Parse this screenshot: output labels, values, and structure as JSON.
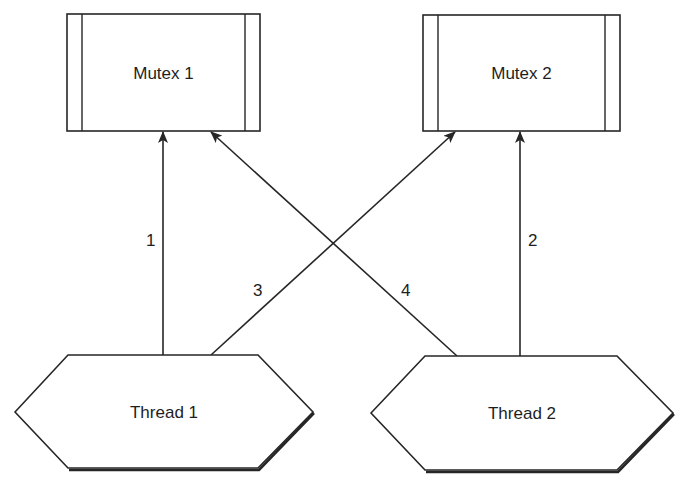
{
  "diagram": {
    "type": "resource-allocation / deadlock diagram",
    "colors": {
      "stroke": "#262626",
      "text": "#1e1e1e",
      "background": "#ffffff"
    },
    "mutexes": [
      {
        "id": "mutex1",
        "label": "Mutex 1",
        "x": 67,
        "y": 14,
        "w": 193,
        "h": 117,
        "inset": 15
      },
      {
        "id": "mutex2",
        "label": "Mutex 2",
        "x": 423,
        "y": 15,
        "w": 197,
        "h": 116,
        "inset": 15
      }
    ],
    "threads": [
      {
        "id": "thread1",
        "label": "Thread 1",
        "points": "15,412 68,355 258,355 313,412 258,468 68,468",
        "cx": 164,
        "cy": 418
      },
      {
        "id": "thread2",
        "label": "Thread 2",
        "points": "371,413 425,356 617,356 673,413 617,470 425,470",
        "cx": 522,
        "cy": 419
      }
    ],
    "edges": [
      {
        "id": "edge1",
        "label": "1",
        "from": "Thread 1",
        "to": "Mutex 1",
        "x1": 163,
        "y1": 355,
        "x2": 163,
        "y2": 132,
        "lx": 146,
        "ly": 246
      },
      {
        "id": "edge2",
        "label": "2",
        "from": "Thread 2",
        "to": "Mutex 2",
        "x1": 520,
        "y1": 356,
        "x2": 520,
        "y2": 132,
        "lx": 528,
        "ly": 246
      },
      {
        "id": "edge3",
        "label": "3",
        "from": "Thread 1",
        "to": "Mutex 2",
        "x1": 211,
        "y1": 355,
        "x2": 455,
        "y2": 132,
        "lx": 253,
        "ly": 296
      },
      {
        "id": "edge4",
        "label": "4",
        "from": "Thread 2",
        "to": "Mutex 1",
        "x1": 457,
        "y1": 356,
        "x2": 211,
        "y2": 132,
        "lx": 401,
        "ly": 296
      }
    ]
  }
}
